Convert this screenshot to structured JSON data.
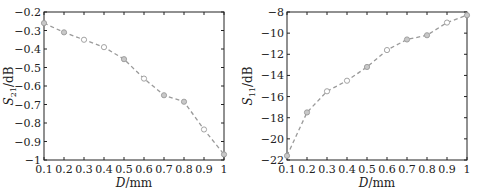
{
  "chart_data": [
    {
      "type": "line",
      "title": "",
      "xlabel": "D/mm",
      "ylabel": "S21/dB",
      "ylabel_main": "S",
      "ylabel_sub": "21",
      "ylabel_unit": "/dB",
      "xlabel_main": "D",
      "xlabel_unit": "/mm",
      "x": [
        0.1,
        0.2,
        0.3,
        0.4,
        0.5,
        0.6,
        0.7,
        0.8,
        0.9,
        1.0
      ],
      "series": [
        {
          "name": "S21",
          "values": [
            -0.26,
            -0.31,
            -0.35,
            -0.39,
            -0.455,
            -0.56,
            -0.65,
            -0.685,
            -0.835,
            -0.97
          ]
        }
      ],
      "xlim": [
        0.1,
        1.0
      ],
      "ylim": [
        -1.0,
        -0.2
      ],
      "xticks": [
        "0.1",
        "0.2",
        "0.3",
        "0.4",
        "0.5",
        "0.6",
        "0.7",
        "0.8",
        "0.9",
        "1"
      ],
      "yticks": [
        "-0.2",
        "-0.3",
        "-0.4",
        "-0.5",
        "-0.6",
        "-0.7",
        "-0.8",
        "-0.9",
        "-1"
      ],
      "grid": false,
      "line_style": "dashed",
      "color": "#9a9a9a"
    },
    {
      "type": "line",
      "title": "",
      "xlabel": "D/mm",
      "ylabel": "S11/dB",
      "ylabel_main": "S",
      "ylabel_sub": "11",
      "ylabel_unit": "/dB",
      "xlabel_main": "D",
      "xlabel_unit": "/mm",
      "x": [
        0.1,
        0.2,
        0.3,
        0.4,
        0.5,
        0.6,
        0.7,
        0.8,
        0.9,
        1.0
      ],
      "series": [
        {
          "name": "S11",
          "values": [
            -21.6,
            -17.5,
            -15.5,
            -14.5,
            -13.2,
            -11.6,
            -10.6,
            -10.2,
            -9.0,
            -8.3
          ]
        }
      ],
      "xlim": [
        0.1,
        1.0
      ],
      "ylim": [
        -22,
        -8
      ],
      "xticks": [
        "0.1",
        "0.2",
        "0.3",
        "0.4",
        "0.5",
        "0.6",
        "0.7",
        "0.8",
        "0.9",
        "1"
      ],
      "yticks": [
        "-8",
        "-10",
        "-12",
        "-14",
        "-16",
        "-18",
        "-20",
        "-22"
      ],
      "grid": false,
      "line_style": "dashed",
      "color": "#9a9a9a"
    }
  ]
}
